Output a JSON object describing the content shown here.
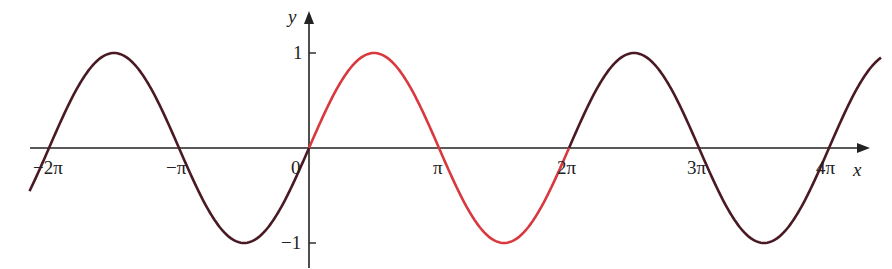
{
  "chart_data": {
    "type": "line",
    "title": "",
    "xlabel": "x",
    "ylabel": "y",
    "function": "y = sin x",
    "xlim": [
      -2.2,
      4.45
    ],
    "xlim_units": "multiples of pi",
    "ylim": [
      -1,
      1
    ],
    "grid": false,
    "legend": null,
    "x_ticks": [
      {
        "value": -2,
        "label": "−2π"
      },
      {
        "value": -1,
        "label": "−π"
      },
      {
        "value": 0,
        "label": "0"
      },
      {
        "value": 1,
        "label": "π"
      },
      {
        "value": 2,
        "label": "2π"
      },
      {
        "value": 3,
        "label": "3π"
      },
      {
        "value": 4,
        "label": "4π"
      }
    ],
    "y_ticks": [
      {
        "value": 1,
        "label": "1"
      },
      {
        "value": -1,
        "label": "−1"
      }
    ],
    "series": [
      {
        "name": "sin x (one period, highlighted)",
        "range_pi": [
          0,
          2
        ],
        "color": "#d8393f"
      },
      {
        "name": "sin x (other periods)",
        "range_pi": [
          -2.15,
          0
        ],
        "color": "#4a1a24"
      },
      {
        "name": "sin x (other periods)",
        "range_pi": [
          2,
          4.4
        ],
        "color": "#4a1a24"
      }
    ]
  },
  "colors": {
    "axis": "#222222",
    "highlight": "#d8393f",
    "curve": "#4a1a24"
  },
  "labels": {
    "x_axis": "x",
    "y_axis": "y",
    "origin": "0"
  }
}
